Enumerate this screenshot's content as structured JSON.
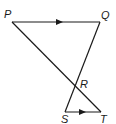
{
  "diagram": {
    "type": "geometry",
    "points": {
      "P": {
        "label": "P",
        "x": 12,
        "y": 22
      },
      "Q": {
        "label": "Q",
        "x": 100,
        "y": 22
      },
      "R": {
        "label": "R",
        "x": 75,
        "y": 88
      },
      "S": {
        "label": "S",
        "x": 65,
        "y": 112
      },
      "T": {
        "label": "T",
        "x": 101,
        "y": 112
      }
    },
    "segments": [
      "PQ",
      "QS",
      "PT",
      "ST"
    ],
    "parallel_marks": [
      "PQ",
      "ST"
    ],
    "stroke_color": "#1a1a1a"
  }
}
